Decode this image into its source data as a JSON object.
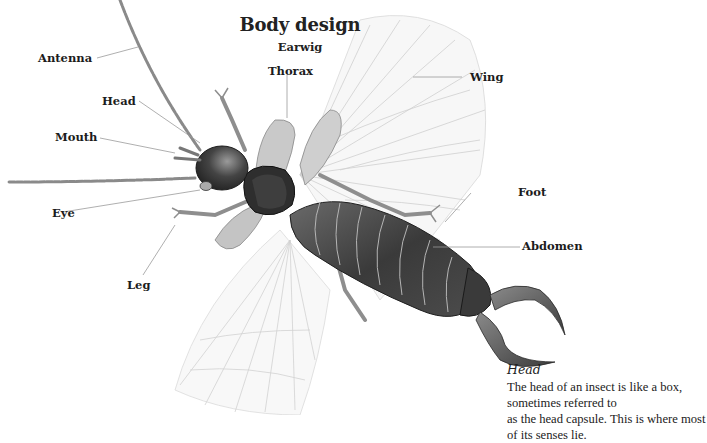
{
  "figure": {
    "title": "Body design",
    "subtitle": "Earwig",
    "labels": {
      "antenna": "Antenna",
      "head": "Head",
      "mouth": "Mouth",
      "eye": "Eye",
      "leg": "Leg",
      "thorax": "Thorax",
      "wing": "Wing",
      "foot": "Foot",
      "abdomen": "Abdomen"
    },
    "caption": {
      "heading": "Head",
      "text_line1": "The head of an insect is like a box, sometimes referred to",
      "text_line2": "as the head capsule. This is where most of its senses lie."
    }
  }
}
